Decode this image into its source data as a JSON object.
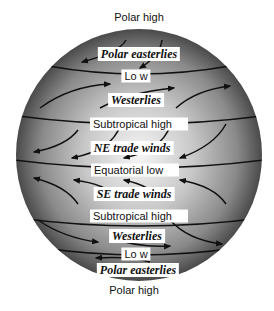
{
  "diagram": {
    "colors": {
      "globe_center": "#f4f4f4",
      "globe_edge": "#4a4a4a",
      "lines": "#111111",
      "label_bg": "#ffffff"
    },
    "labels": {
      "top_outside": "Polar high",
      "polar_easterlies_n": "Polar easterlies",
      "low_n": "Lo w",
      "westerlies_n": "Westerlies",
      "subtropical_high_n": "Subtropical high",
      "ne_trade_winds": "NE trade winds",
      "equatorial_low": "Equatorial low",
      "se_trade_winds": "SE trade winds",
      "subtropical_high_s": "Subtropical high",
      "westerlies_s": "Westerlies",
      "low_s": "Lo w",
      "polar_easterlies_s": "Polar easterlies",
      "bottom_outside": "Polar high"
    },
    "belts": [
      {
        "name": "Polar high",
        "hemisphere": "N",
        "type": "pressure"
      },
      {
        "name": "Polar easterlies",
        "hemisphere": "N",
        "type": "wind"
      },
      {
        "name": "Low",
        "hemisphere": "N",
        "type": "pressure"
      },
      {
        "name": "Westerlies",
        "hemisphere": "N",
        "type": "wind"
      },
      {
        "name": "Subtropical high",
        "hemisphere": "N",
        "type": "pressure"
      },
      {
        "name": "NE trade winds",
        "hemisphere": "N",
        "type": "wind"
      },
      {
        "name": "Equatorial low",
        "hemisphere": "Eq",
        "type": "pressure"
      },
      {
        "name": "SE trade winds",
        "hemisphere": "S",
        "type": "wind"
      },
      {
        "name": "Subtropical high",
        "hemisphere": "S",
        "type": "pressure"
      },
      {
        "name": "Westerlies",
        "hemisphere": "S",
        "type": "wind"
      },
      {
        "name": "Low",
        "hemisphere": "S",
        "type": "pressure"
      },
      {
        "name": "Polar easterlies",
        "hemisphere": "S",
        "type": "wind"
      },
      {
        "name": "Polar high",
        "hemisphere": "S",
        "type": "pressure"
      }
    ]
  }
}
